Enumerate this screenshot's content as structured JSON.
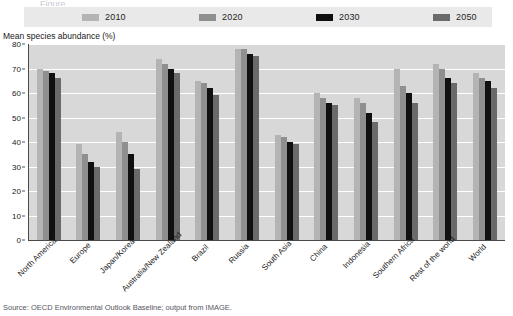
{
  "title_ghost": "Figure",
  "legend": {
    "items": [
      {
        "label": "2010",
        "color": "#b4b4b4"
      },
      {
        "label": "2020",
        "color": "#8f8f8f"
      },
      {
        "label": "2030",
        "color": "#101010"
      },
      {
        "label": "2050",
        "color": "#6a6a6a"
      }
    ]
  },
  "source": "Source: OECD Environmental Outlook Baseline; output from IMAGE.",
  "chart_data": {
    "type": "bar",
    "title": "",
    "xlabel": "",
    "ylabel": "Mean species abundance (%)",
    "ylim": [
      0,
      80
    ],
    "yticks": [
      0,
      10,
      20,
      30,
      40,
      50,
      60,
      70,
      80
    ],
    "grid": true,
    "legend_position": "top",
    "categories": [
      "North America",
      "Europe",
      "Japan/Korea",
      "Australia/New Zealand",
      "Brazil",
      "Russia",
      "South Asia",
      "China",
      "Indonesia",
      "Southern Africa",
      "Rest of the world",
      "World"
    ],
    "series": [
      {
        "name": "2010",
        "color": "#b4b4b4",
        "values": [
          70,
          39,
          44,
          74,
          65,
          78,
          43,
          60,
          58,
          70,
          72,
          68
        ]
      },
      {
        "name": "2020",
        "color": "#8f8f8f",
        "values": [
          69,
          35,
          40,
          72,
          64,
          78,
          42,
          58,
          56,
          63,
          70,
          66
        ]
      },
      {
        "name": "2030",
        "color": "#101010",
        "values": [
          68,
          32,
          35,
          70,
          62,
          76,
          40,
          56,
          52,
          60,
          66,
          65
        ]
      },
      {
        "name": "2050",
        "color": "#6a6a6a",
        "values": [
          66,
          30,
          29,
          68,
          59,
          75,
          39,
          55,
          48,
          56,
          64,
          62
        ]
      }
    ]
  }
}
